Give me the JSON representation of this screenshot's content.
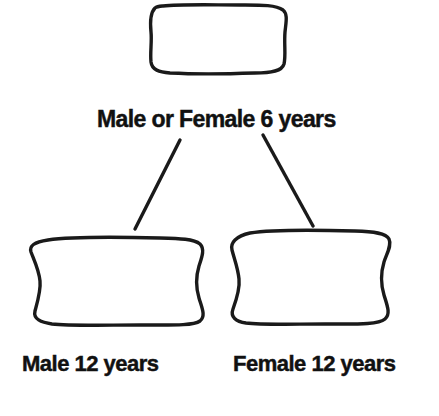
{
  "figure": {
    "background_color": "#ffffff",
    "ink_color": "#1a1a1a",
    "text_color": "#111111"
  },
  "labels": {
    "top": "Male or Female 6 years",
    "bottom_left": "Male 12 years",
    "bottom_right": "Female 12 years"
  },
  "shapes": {
    "top": {
      "name": "vertebral-body-outline-6-years",
      "description": "rounded rectangle with slightly wavy edges"
    },
    "bottom_left": {
      "name": "vertebral-body-outline-male-12-years",
      "description": "rounded rectangle with concave pinched sides"
    },
    "bottom_right": {
      "name": "vertebral-body-outline-female-12-years",
      "description": "rounded rectangle with concave pinched sides"
    }
  },
  "connectors": [
    {
      "name": "connector-to-male",
      "from": "top-shape",
      "to": "bottom-left-shape"
    },
    {
      "name": "connector-to-female",
      "from": "top-shape",
      "to": "bottom-right-shape"
    }
  ]
}
